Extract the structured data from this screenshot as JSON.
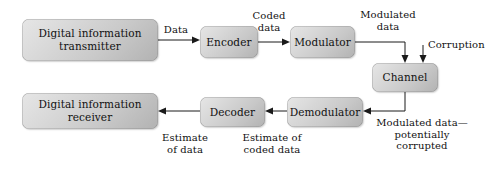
{
  "diagram": {
    "background_color": "#ffffff",
    "node_fill_light": "#e6e6e6",
    "node_fill_dark": "#b2b2b2",
    "line_color": "#1a1a1a",
    "text_color": "#111111"
  },
  "nodes": {
    "transmitter": {
      "label": "Digital information\ntransmitter"
    },
    "encoder": {
      "label": "Encoder"
    },
    "modulator": {
      "label": "Modulator"
    },
    "channel": {
      "label": "Channel"
    },
    "demodulator": {
      "label": "Demodulator"
    },
    "decoder": {
      "label": "Decoder"
    },
    "receiver": {
      "label": "Digital information\nreceiver"
    }
  },
  "edge_labels": {
    "data": "Data",
    "coded_data": "Coded\ndata",
    "modulated_data": "Modulated\ndata",
    "corruption": "Corruption",
    "modulated_corrupted": "Modulated data—\npotentially\ncorrupted",
    "estimate_of_coded_data": "Estimate of\ncoded data",
    "estimate_of_data": "Estimate\nof data"
  }
}
